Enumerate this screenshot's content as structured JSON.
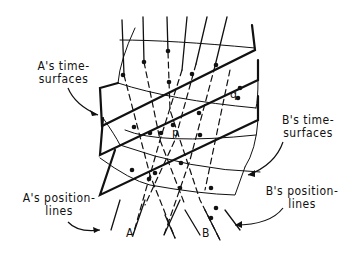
{
  "labels": {
    "a_time_surfaces": [
      "A's time-",
      "surfaces"
    ],
    "b_time_surfaces": [
      "B's time-",
      "surfaces"
    ],
    "a_position_lines": [
      "A's position-",
      "lines"
    ],
    "b_position_lines": [
      "B's position-",
      "lines"
    ],
    "line_a": "A",
    "line_b": "B",
    "point_p": "p",
    "point_q": "q"
  },
  "colors": {
    "ink": "#111111",
    "background": "#ffffff"
  }
}
